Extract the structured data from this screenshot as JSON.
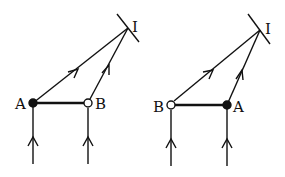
{
  "figure": {
    "background": "#ffffff",
    "ink": "#111111",
    "panels": [
      {
        "id": "left",
        "point_A": {
          "label": "A",
          "x": 33,
          "y": 103,
          "style": "filled"
        },
        "point_B": {
          "label": "B",
          "x": 88,
          "y": 103,
          "style": "open"
        },
        "point_I": {
          "label": "I",
          "x": 128,
          "y": 28
        },
        "mirror": {
          "x1": 117,
          "y1": 14,
          "x2": 139,
          "y2": 42
        },
        "label_A_pos": {
          "x": 16,
          "y": 109
        },
        "label_B_pos": {
          "x": 94,
          "y": 109
        },
        "label_I_pos": {
          "x": 133,
          "y": 28
        }
      },
      {
        "id": "right",
        "point_A": {
          "label": "A",
          "x": 227,
          "y": 105,
          "style": "filled"
        },
        "point_B": {
          "label": "B",
          "x": 171,
          "y": 105,
          "style": "open"
        },
        "point_I": {
          "label": "I",
          "x": 260,
          "y": 30
        },
        "mirror": {
          "x1": 248,
          "y1": 14,
          "x2": 270,
          "y2": 44
        },
        "label_A_pos": {
          "x": 232,
          "y": 112
        },
        "label_B_pos": {
          "x": 153,
          "y": 112
        },
        "label_I_pos": {
          "x": 265,
          "y": 30
        }
      }
    ],
    "labels": {
      "left_A": "A",
      "left_B": "B",
      "left_I": "I",
      "right_A": "A",
      "right_B": "B",
      "right_I": "I"
    }
  }
}
